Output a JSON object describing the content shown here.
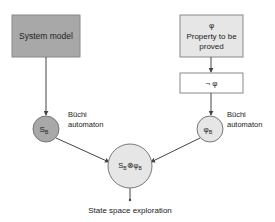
{
  "diagram": {
    "system_model": {
      "label": "System model",
      "fill": "#a8a8a8"
    },
    "property": {
      "symbol": "φ",
      "line1": "Property to be",
      "line2": "proved",
      "fill": "#e6e6e6"
    },
    "negation": {
      "label": "¬ φ",
      "fill": "#ffffff"
    },
    "system_buchi": {
      "main": "S",
      "sub": "B",
      "fill": "#a8a8a8",
      "caption1": "Büchi",
      "caption2": "automaton"
    },
    "property_buchi": {
      "main": "φ",
      "sub": "B",
      "fill": "#e6e6e6",
      "caption1": "Büchi",
      "caption2": "automaton"
    },
    "product": {
      "left_main": "S",
      "left_sub": "B",
      "op": "⊗",
      "right_main": "φ",
      "right_sub": "B",
      "fill": "#e6e6e6"
    },
    "result_label": "State space exploration"
  }
}
